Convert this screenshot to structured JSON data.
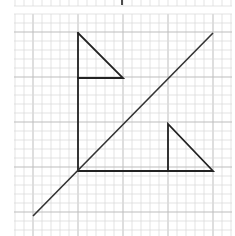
{
  "figure": {
    "grid": {
      "minor_cell_px": 9,
      "major_every": 5,
      "minor_color": "#dcdcdc",
      "major_color": "#bdbdbd",
      "origin_px": [
        14,
        14
      ],
      "extent_px": [
        232,
        236
      ]
    },
    "top_strip": {
      "description": "partial grid from previous panel",
      "mark_x": 122
    },
    "line_color": "#222222",
    "shapes": {
      "upper_triangle": {
        "points": [
          [
            78,
            33
          ],
          [
            78,
            78
          ],
          [
            123,
            78
          ]
        ]
      },
      "lower_triangle": {
        "points": [
          [
            168,
            124
          ],
          [
            168,
            171
          ],
          [
            213,
            171
          ]
        ]
      },
      "vertical_axis": {
        "from": [
          78,
          78
        ],
        "to": [
          78,
          171
        ]
      },
      "horizontal_axis": {
        "from": [
          78,
          171
        ],
        "to": [
          168,
          171
        ]
      },
      "mirror_line": {
        "from": [
          33,
          216
        ],
        "to": [
          213,
          33
        ]
      }
    }
  }
}
